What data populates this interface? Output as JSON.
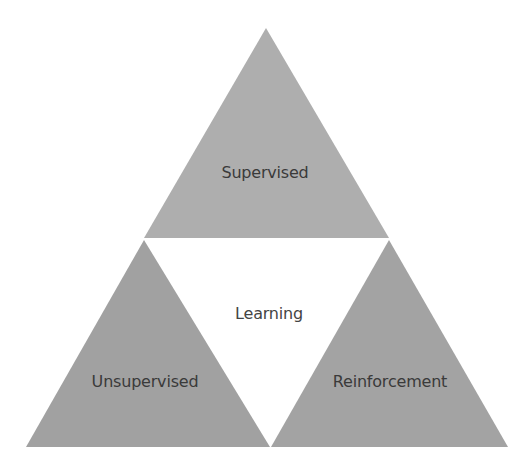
{
  "diagram": {
    "type": "triangle-triad",
    "center_label": "Learning",
    "triangles": [
      {
        "id": "top",
        "label": "Supervised",
        "points": [
          [
            266,
            28
          ],
          [
            144,
            238
          ],
          [
            389,
            238
          ]
        ],
        "fill": "#aeaeae",
        "label_pos": [
          265,
          163
        ]
      },
      {
        "id": "bottom-left",
        "label": "Unsupervised",
        "points": [
          [
            144,
            240
          ],
          [
            26,
            447
          ],
          [
            270,
            447
          ]
        ],
        "fill": "#a1a1a1",
        "label_pos": [
          145,
          372
        ]
      },
      {
        "id": "bottom-right",
        "label": "Reinforcement",
        "points": [
          [
            389,
            240
          ],
          [
            271,
            447
          ],
          [
            508,
            447
          ]
        ],
        "fill": "#a3a3a3",
        "label_pos": [
          390,
          372
        ]
      }
    ],
    "center_label_pos": [
      269,
      304
    ],
    "text_color": "#3a3a3a",
    "background": "#ffffff"
  }
}
